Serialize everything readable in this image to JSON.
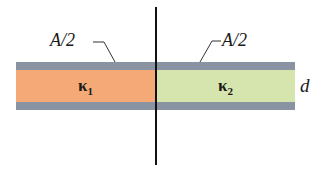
{
  "diagram": {
    "labels": {
      "area_left": "A/2",
      "area_right": "A/2",
      "kappa1_symbol": "κ",
      "kappa1_sub": "1",
      "kappa2_symbol": "κ",
      "kappa2_sub": "2",
      "separation": "d"
    },
    "colors": {
      "plate": "#8a93a1",
      "dielectric_left": "#f4a977",
      "dielectric_right": "#d5e5ad",
      "divider": "#111111"
    }
  }
}
